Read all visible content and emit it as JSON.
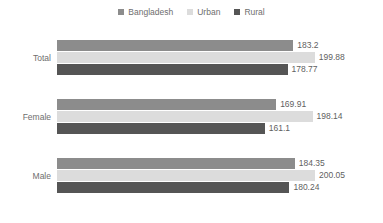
{
  "legend": {
    "position": "top-center",
    "entries": [
      {
        "label": "Bangladesh",
        "color": "#8c8c8c",
        "icon": "legend-square-icon"
      },
      {
        "label": "Urban",
        "color": "#dcdcdc",
        "icon": "legend-square-icon"
      },
      {
        "label": "Rural",
        "color": "#555555",
        "icon": "legend-square-icon"
      }
    ]
  },
  "chart_data": {
    "type": "bar",
    "orientation": "horizontal",
    "title": "",
    "subtitle": "",
    "xlabel": "",
    "ylabel": "",
    "grid": false,
    "legend_position": "top-center",
    "xlim": [
      0,
      200.05
    ],
    "categories": [
      "Total",
      "Female",
      "Male"
    ],
    "series": [
      {
        "name": "Bangladesh",
        "color": "#8c8c8c",
        "values": [
          183.2,
          169.91,
          184.35
        ]
      },
      {
        "name": "Urban",
        "color": "#dcdcdc",
        "values": [
          199.88,
          198.14,
          200.05
        ]
      },
      {
        "name": "Rural",
        "color": "#555555",
        "values": [
          178.77,
          161.1,
          180.24
        ]
      }
    ],
    "value_labels": [
      [
        "183.2",
        "199.88",
        "178.77"
      ],
      [
        "169.91",
        "198.14",
        "161.1"
      ],
      [
        "184.35",
        "200.05",
        "180.24"
      ]
    ]
  }
}
